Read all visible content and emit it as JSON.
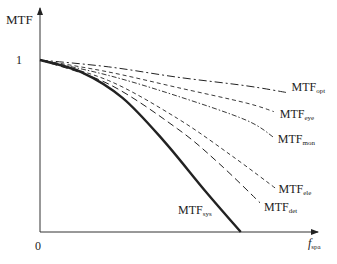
{
  "chart_data": {
    "type": "line",
    "title": "",
    "xlabel": "f_spa",
    "ylabel": "MTF",
    "xlim": [
      0,
      1
    ],
    "ylim": [
      0,
      1.3
    ],
    "x_ticks": [
      {
        "value": 0,
        "label": "0"
      }
    ],
    "y_ticks": [
      {
        "value": 1,
        "label": "1"
      }
    ],
    "grid": false,
    "legend": "inline-labels-at-line-ends",
    "series": [
      {
        "name": "MTF_opt",
        "base": "MTF",
        "sub": "opt",
        "style": "dash-dot",
        "x": [
          0,
          0.25,
          0.5,
          0.75,
          0.9
        ],
        "y": [
          1,
          0.96,
          0.9,
          0.85,
          0.81
        ]
      },
      {
        "name": "MTF_eye",
        "base": "MTF",
        "sub": "eye",
        "style": "dashed-fine",
        "x": [
          0,
          0.25,
          0.5,
          0.75,
          0.85
        ],
        "y": [
          1,
          0.93,
          0.84,
          0.75,
          0.7
        ]
      },
      {
        "name": "MTF_mon",
        "base": "MTF",
        "sub": "mon",
        "style": "dash-dot-fine",
        "x": [
          0,
          0.25,
          0.5,
          0.75,
          0.85
        ],
        "y": [
          1,
          0.91,
          0.79,
          0.65,
          0.55
        ]
      },
      {
        "name": "MTF_ele",
        "base": "MTF",
        "sub": "ele",
        "style": "dashed-fine",
        "x": [
          0,
          0.25,
          0.5,
          0.7,
          0.86
        ],
        "y": [
          1,
          0.88,
          0.66,
          0.44,
          0.25
        ]
      },
      {
        "name": "MTF_det",
        "base": "MTF",
        "sub": "det",
        "style": "dashed",
        "x": [
          0,
          0.25,
          0.5,
          0.65,
          0.8
        ],
        "y": [
          1,
          0.86,
          0.6,
          0.4,
          0.17
        ]
      },
      {
        "name": "MTF_sys",
        "base": "MTF",
        "sub": "sys",
        "style": "solid-thick",
        "x": [
          0,
          0.15,
          0.3,
          0.45,
          0.6,
          0.73
        ],
        "y": [
          1,
          0.93,
          0.78,
          0.53,
          0.24,
          0
        ]
      }
    ]
  },
  "axis": {
    "y_label": "MTF",
    "x_label_base": "f",
    "x_label_sub": "spa",
    "origin": "0",
    "one": "1"
  }
}
